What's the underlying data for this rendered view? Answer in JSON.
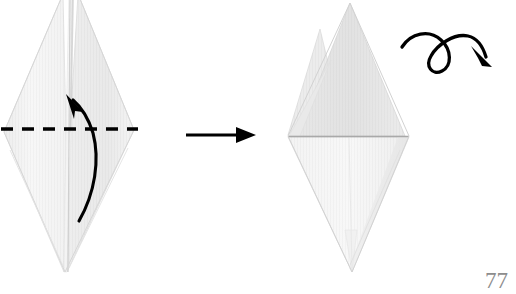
{
  "document": {
    "kind": "origami-instruction-diagram",
    "page_number": "77",
    "background_color": "#ffffff"
  },
  "palette": {
    "paper_light": "#f7f7f7",
    "paper_mid": "#efefef",
    "paper_shade": "#e8e8e8",
    "paper_shade_dark": "#e0e0e0",
    "paper_edge": "#d4d4d4",
    "crease_line": "#b8b8b8",
    "ink": "#000000",
    "page_number_color": "#8d8d8d"
  },
  "steps": [
    {
      "id": "step-before",
      "name": "left-origami-figure",
      "description": "Tall narrow diamond (kite base) with two split points at top and a single point at bottom",
      "label": "",
      "bounds": {
        "x": 3,
        "y": 0,
        "width": 132,
        "height": 275
      },
      "annotations": [
        {
          "type": "valley-fold-line",
          "name": "dashed-fold-line",
          "style": "dashed",
          "color": "#000000",
          "x1": 1,
          "y1": 129,
          "x2": 138,
          "y2": 129,
          "dash": "11 8",
          "width": 3.2
        },
        {
          "type": "fold-arrow",
          "name": "valley-fold-curved-arrow",
          "direction": "upward",
          "color": "#000000",
          "start": {
            "x": 79,
            "y": 221
          },
          "end": {
            "x": 69,
            "y": 97
          }
        }
      ]
    },
    {
      "id": "step-after",
      "name": "right-origami-figure",
      "description": "Resulting diamond with upper triangle folded down, one tall point and one short point at top, single point at bottom",
      "label": "",
      "bounds": {
        "x": 287,
        "y": 2,
        "width": 122,
        "height": 272
      },
      "annotations": [
        {
          "type": "crease-line",
          "name": "horizontal-crease-line",
          "style": "solid",
          "color": "#a8a8a8",
          "x1": 288,
          "y1": 136,
          "x2": 409,
          "y2": 136,
          "width": 1.4
        },
        {
          "type": "turn-over-arrow",
          "name": "turn-over-loop-arrow",
          "meaning": "turn the model over",
          "color": "#000000",
          "start": {
            "x": 402,
            "y": 46
          },
          "end": {
            "x": 489,
            "y": 63
          }
        }
      ]
    }
  ],
  "connectors": [
    {
      "type": "transition-arrow",
      "name": "step-transition-arrow",
      "direction": "right",
      "color": "#000000",
      "x1": 186,
      "y1": 135,
      "x2": 254,
      "y2": 135,
      "width": 3
    }
  ]
}
